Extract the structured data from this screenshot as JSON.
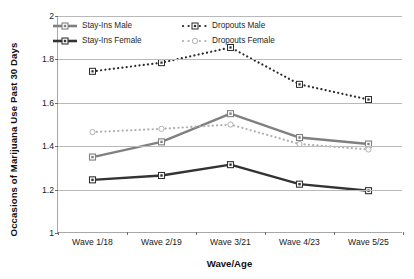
{
  "chart_data": {
    "type": "line",
    "title": "",
    "xlabel": "Wave/Age",
    "ylabel": "Occasions of Marijuana Use Past 30 Days",
    "categories": [
      "Wave 1/18",
      "Wave 2/19",
      "Wave 3/21",
      "Wave 4/23",
      "Wave 5/25"
    ],
    "ylim": [
      1,
      2
    ],
    "yticks": [
      "1",
      "1.2",
      "1.4",
      "1.6",
      "1.8",
      "2"
    ],
    "ytick_values": [
      1,
      1.2,
      1.4,
      1.6,
      1.8,
      2
    ],
    "grid": true,
    "legend_position": "top-inside",
    "series": [
      {
        "name": "Stay-Ins Male",
        "values": [
          1.35,
          1.42,
          1.55,
          1.44,
          1.41
        ],
        "color": "#808080",
        "style": "solid",
        "marker": "square"
      },
      {
        "name": "Stay-Ins Female",
        "values": [
          1.245,
          1.265,
          1.315,
          1.225,
          1.195
        ],
        "color": "#333333",
        "style": "solid",
        "marker": "square"
      },
      {
        "name": "Dropouts Male",
        "values": [
          1.745,
          1.785,
          1.855,
          1.685,
          1.615
        ],
        "color": "#2b2b2b",
        "style": "dotted",
        "marker": "square-open"
      },
      {
        "name": "Dropouts Female",
        "values": [
          1.465,
          1.48,
          1.5,
          1.41,
          1.385
        ],
        "color": "#b0b0b0",
        "style": "dotted",
        "marker": "circle-open"
      }
    ]
  }
}
